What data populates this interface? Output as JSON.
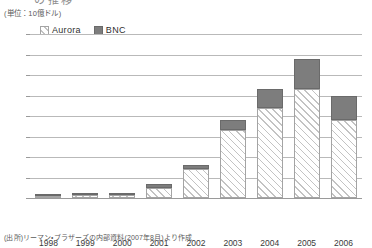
{
  "figure": {
    "title_cut": "の推移",
    "unit_label": "(単位：10億ドル)",
    "source_note": "(出所)リーマン・ブラザーズの内部資料(2007年8月)より作成"
  },
  "legend": {
    "position": "top-left",
    "items": [
      {
        "label": "Aurora",
        "swatch": "hatched-diagonal",
        "color": "#f4f4f4"
      },
      {
        "label": "BNC",
        "swatch": "solid-gray",
        "color": "#7d7d7d"
      }
    ]
  },
  "chart_data": {
    "type": "bar",
    "stacked": true,
    "title": "",
    "xlabel": "",
    "ylabel": "",
    "unit": "10億ドル",
    "ylim": [
      0,
      80
    ],
    "yticks": [
      0,
      10,
      20,
      30,
      40,
      50,
      60,
      70,
      80
    ],
    "ytick_labels": [
      "0",
      "10",
      "20",
      "30",
      "40",
      "50",
      "60",
      "70",
      "80"
    ],
    "grid": true,
    "legend_position": "top-left",
    "categories": [
      "1998",
      "1999",
      "2000",
      "2001",
      "2002",
      "2003",
      "2004",
      "2005",
      "2006"
    ],
    "series": [
      {
        "name": "Aurora",
        "values": [
          0.5,
          1.5,
          1.5,
          5,
          14,
          33,
          44,
          53,
          38
        ]
      },
      {
        "name": "BNC",
        "values": [
          0.5,
          0.8,
          0.8,
          2,
          2,
          5,
          9,
          15,
          12
        ]
      }
    ],
    "totals": [
      1,
      2.3,
      2.3,
      7,
      16,
      38,
      53,
      68,
      50
    ]
  }
}
